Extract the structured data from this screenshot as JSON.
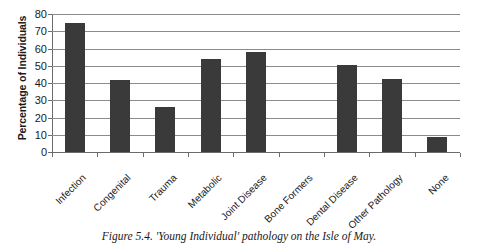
{
  "chart_data": {
    "type": "bar",
    "title": "",
    "subtitle": "",
    "xlabel": "",
    "ylabel": "Percentage of Individuals",
    "ylim": [
      0,
      80
    ],
    "ytick_step": 10,
    "yticks": [
      80,
      70,
      60,
      50,
      40,
      30,
      20,
      10,
      0
    ],
    "grid": true,
    "legend": false,
    "legend_position": "none",
    "bar_color": "#3a3a3a",
    "grid_color": "#8b8b8b",
    "axis_color": "#6b6b6b",
    "xtick_rotation": -45,
    "categories": [
      "Infection",
      "Congenital",
      "Trauma",
      "Metabolic",
      "Joint Disease",
      "Bone Formers",
      "Dental Disease",
      "Other Pathology",
      "None"
    ],
    "values": [
      75,
      42,
      26,
      54,
      58,
      0,
      50.5,
      42.5,
      8.5
    ]
  },
  "caption": {
    "text": "Figure 5.4. 'Young Individual' pathology on the Isle of May."
  }
}
